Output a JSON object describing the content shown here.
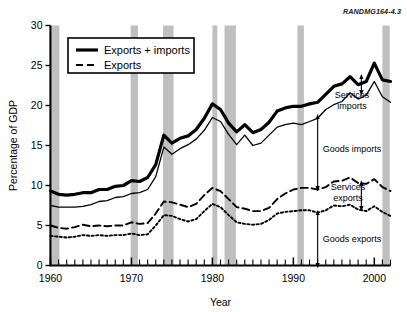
{
  "figure": {
    "id_label": "RANDMG164-4.3"
  },
  "chart_data": {
    "type": "line",
    "title": "",
    "xlabel": "Year",
    "ylabel": "Percentage of GDP",
    "xlim": [
      1960,
      2002
    ],
    "ylim": [
      0,
      30
    ],
    "yticks": [
      0,
      5,
      10,
      15,
      20,
      25,
      30
    ],
    "xticks_labeled": [
      1960,
      1970,
      1980,
      1990,
      2000
    ],
    "xtick_step_minor": 1,
    "grid": false,
    "legend_position": "upper-left-inside",
    "x": [
      1960,
      1961,
      1962,
      1963,
      1964,
      1965,
      1966,
      1967,
      1968,
      1969,
      1970,
      1971,
      1972,
      1973,
      1974,
      1975,
      1976,
      1977,
      1978,
      1979,
      1980,
      1981,
      1982,
      1983,
      1984,
      1985,
      1986,
      1987,
      1988,
      1989,
      1990,
      1991,
      1992,
      1993,
      1994,
      1995,
      1996,
      1997,
      1998,
      1999,
      2000,
      2001,
      2002
    ],
    "series": [
      {
        "name": "Exports + imports",
        "style": "solid-thick",
        "values": [
          9.3,
          8.9,
          8.8,
          8.9,
          9.1,
          9.1,
          9.5,
          9.5,
          9.9,
          10.0,
          10.6,
          10.5,
          11.0,
          12.6,
          16.3,
          15.3,
          15.9,
          16.2,
          17.0,
          18.4,
          20.2,
          19.5,
          17.8,
          16.7,
          17.6,
          16.6,
          17.0,
          17.9,
          19.3,
          19.7,
          19.9,
          19.9,
          20.2,
          20.4,
          21.4,
          22.4,
          22.7,
          23.6,
          22.6,
          23.0,
          25.3,
          23.2,
          23.0
        ]
      },
      {
        "name": "Goods + services imports (upper boundary of goods imports band)",
        "style": "solid-thin",
        "values": [
          7.5,
          7.3,
          7.3,
          7.3,
          7.4,
          7.6,
          8.0,
          8.1,
          8.5,
          8.6,
          9.0,
          9.1,
          9.5,
          11.1,
          14.8,
          13.9,
          14.6,
          15.1,
          15.8,
          16.9,
          18.5,
          18.0,
          16.4,
          15.1,
          16.3,
          15.0,
          15.3,
          16.3,
          17.3,
          17.6,
          17.8,
          17.6,
          18.0,
          18.4,
          19.5,
          20.1,
          20.5,
          21.6,
          20.8,
          21.3,
          23.0,
          21.1,
          20.4
        ]
      },
      {
        "name": "Exports",
        "style": "dashed",
        "values": [
          5.0,
          4.7,
          4.6,
          4.8,
          5.1,
          4.9,
          5.0,
          4.9,
          5.0,
          5.0,
          5.4,
          5.2,
          5.3,
          6.5,
          8.0,
          7.9,
          7.6,
          7.3,
          7.7,
          8.8,
          9.7,
          9.3,
          8.3,
          7.3,
          7.1,
          6.8,
          6.8,
          7.2,
          8.3,
          9.0,
          9.5,
          9.7,
          9.7,
          9.5,
          9.8,
          10.5,
          10.6,
          11.0,
          10.3,
          10.2,
          10.8,
          9.8,
          9.3
        ]
      },
      {
        "name": "Goods exports",
        "style": "dotted",
        "values": [
          3.7,
          3.6,
          3.5,
          3.6,
          3.8,
          3.7,
          3.8,
          3.7,
          3.8,
          3.8,
          4.0,
          3.8,
          3.9,
          5.0,
          6.3,
          6.2,
          5.8,
          5.5,
          5.8,
          6.8,
          7.7,
          7.3,
          6.3,
          5.4,
          5.2,
          5.1,
          5.2,
          5.7,
          6.5,
          6.7,
          6.8,
          6.9,
          6.9,
          6.6,
          6.9,
          7.5,
          7.4,
          7.6,
          7.0,
          6.8,
          7.4,
          6.7,
          6.2
        ]
      }
    ],
    "shaded_bands": [
      {
        "label": "recession",
        "start": 1960.2,
        "end": 1961.1
      },
      {
        "label": "recession",
        "start": 1969.9,
        "end": 1970.8
      },
      {
        "label": "recession",
        "start": 1973.9,
        "end": 1975.2
      },
      {
        "label": "recession",
        "start": 1980.0,
        "end": 1980.6
      },
      {
        "label": "recession",
        "start": 1981.5,
        "end": 1982.9
      },
      {
        "label": "recession",
        "start": 1990.5,
        "end": 1991.3
      },
      {
        "label": "recession",
        "start": 2001.0,
        "end": 2001.9
      }
    ],
    "annotations": [
      {
        "text": "Services imports",
        "lines": [
          "Services",
          "imports"
        ],
        "x": 1998.4,
        "y_top": 23.6,
        "y_bottom": 21.6
      },
      {
        "text": "Goods imports",
        "lines": [
          "Goods imports"
        ],
        "x": 1993.0,
        "y_top": 18.6,
        "y_bottom": 9.6
      },
      {
        "text": "Services exports",
        "lines": [
          "Services",
          "exports"
        ],
        "x": 1998.4,
        "y_top": 10.3,
        "y_bottom": 7.1
      },
      {
        "text": "Goods exports",
        "lines": [
          "Goods exports"
        ],
        "x": 1993.0,
        "y_top": 6.6,
        "y_bottom": 0.0
      }
    ],
    "legend": [
      {
        "label": "Exports + imports",
        "style": "solid-thick"
      },
      {
        "label": "Exports",
        "style": "dashed"
      }
    ]
  },
  "colors": {
    "line": "#000000",
    "band": "#bfbfbf",
    "background": "#ffffff",
    "axis": "#000000"
  }
}
